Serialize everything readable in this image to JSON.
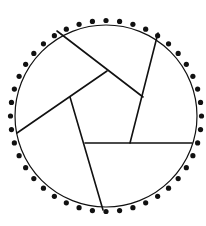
{
  "diagram": {
    "title": "",
    "background": "#ffffff",
    "stroke_color": "#111111",
    "circle": {
      "cx": 106,
      "cy": 116,
      "r": 91,
      "stroke_width": 1.2
    },
    "dots": {
      "count": 44,
      "ring_radius": 95.5,
      "dot_radius": 2.6,
      "start_angle_deg": 0
    },
    "lines": [
      {
        "x1": 57,
        "y1": 31,
        "x2": 143,
        "y2": 97,
        "width": 1.6
      },
      {
        "x1": 158,
        "y1": 33,
        "x2": 130,
        "y2": 143,
        "width": 1.6
      },
      {
        "x1": 192,
        "y1": 143,
        "x2": 85,
        "y2": 143,
        "width": 1.6
      },
      {
        "x1": 103,
        "y1": 210,
        "x2": 70,
        "y2": 97,
        "width": 1.6
      },
      {
        "x1": 17,
        "y1": 133,
        "x2": 107,
        "y2": 71,
        "width": 1.6
      }
    ]
  }
}
